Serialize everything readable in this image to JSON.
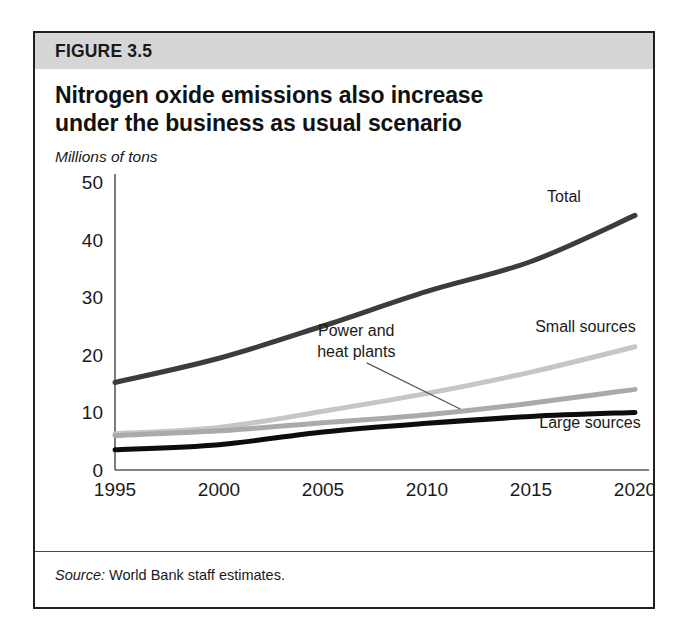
{
  "figure": {
    "band_label": "FIGURE 3.5",
    "title_line_1": "Nitrogen oxide emissions also increase",
    "title_line_2": "under the business as usual scenario",
    "units_label": "Millions of tons",
    "source_lead": "Source:",
    "source_text": " World Bank staff estimates."
  },
  "chart_data": {
    "type": "line",
    "title": "Nitrogen oxide emissions also increase under the business as usual scenario",
    "subtitle": "",
    "xlabel": "",
    "ylabel": "Millions of tons",
    "x": [
      1995,
      2000,
      2005,
      2010,
      2015,
      2020
    ],
    "xticklabels": [
      "1995",
      "2000",
      "2005",
      "2010",
      "2015",
      "2020"
    ],
    "yticklabels": [
      "0",
      "10",
      "20",
      "30",
      "40",
      "50"
    ],
    "yticks": [
      0,
      10,
      20,
      30,
      40,
      50
    ],
    "xlim": [
      1995,
      2020
    ],
    "ylim": [
      0,
      50
    ],
    "grid": false,
    "legend": "inline-annotations",
    "series": [
      {
        "name": "Total",
        "color": "#3c3c3c",
        "width": 5.0,
        "values": [
          15.2,
          19.4,
          25.0,
          31.0,
          36.2,
          44.2
        ],
        "label_x": 2017.4,
        "label_y": 46.6,
        "label_anchor": "end"
      },
      {
        "name": "Small sources",
        "color": "#c6c6c6",
        "width": 5.0,
        "values": [
          6.3,
          7.4,
          10.2,
          13.3,
          17.0,
          21.4
        ],
        "label_x": 2015.2,
        "label_y": 24.0,
        "label_anchor": "start"
      },
      {
        "name": "Power and heat plants",
        "color": "#aaaaaa",
        "width": 5.0,
        "values": [
          6.0,
          6.8,
          8.2,
          9.6,
          11.6,
          14.0
        ],
        "label_x": 2006.6,
        "label_y": 23.2,
        "label_anchor": "middle",
        "label_line_2": "heat plants",
        "leader": {
          "x1": 2007.1,
          "y1": 18.6,
          "x2": 2011.6,
          "y2": 10.6
        }
      },
      {
        "name": "Large sources",
        "color": "#0d0d0d",
        "width": 5.0,
        "values": [
          3.5,
          4.4,
          6.6,
          8.1,
          9.3,
          10.0
        ],
        "label_x": 2015.4,
        "label_y": 7.3,
        "label_anchor": "start"
      }
    ]
  }
}
